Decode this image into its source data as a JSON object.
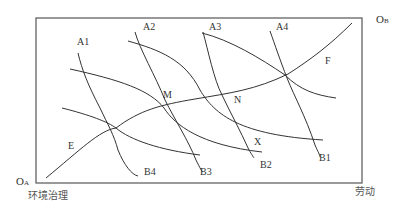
{
  "diagram": {
    "type": "edgeworth-box",
    "origins": {
      "a": {
        "main": "O",
        "sub": "A"
      },
      "b": {
        "main": "O",
        "sub": "B"
      }
    },
    "axis_labels": {
      "bottom_left": "环境治理",
      "bottom_right": "劳动"
    },
    "curve_labels": {
      "a": [
        "A1",
        "A2",
        "A3",
        "A4"
      ],
      "b": [
        "B1",
        "B2",
        "B3",
        "B4"
      ],
      "contract_start": "E",
      "contract_end": "F"
    },
    "points": {
      "m": "M",
      "n": "N",
      "x": "X"
    },
    "colors": {
      "line": "#333333",
      "frame": "#555555",
      "background": "#ffffff"
    }
  }
}
